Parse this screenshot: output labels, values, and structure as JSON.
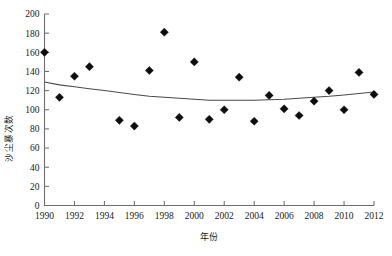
{
  "chart_data": {
    "type": "scatter",
    "title": "",
    "xlabel": "年份",
    "ylabel": "沙尘暴次数",
    "xlim": [
      1990,
      2012
    ],
    "ylim": [
      0,
      200
    ],
    "grid": false,
    "legend": null,
    "x_ticks": [
      "1990",
      "1992",
      "1994",
      "1996",
      "1998",
      "2000",
      "2002",
      "2004",
      "2006",
      "2008",
      "2010",
      "2012"
    ],
    "x_tick_values": [
      1990,
      1992,
      1994,
      1996,
      1998,
      2000,
      2002,
      2004,
      2006,
      2008,
      2010,
      2012
    ],
    "x_minor_ticks": [
      1991,
      1993,
      1995,
      1997,
      1999,
      2001,
      2003,
      2005,
      2007,
      2009,
      2011
    ],
    "y_ticks": [
      "0",
      "20",
      "40",
      "60",
      "80",
      "100",
      "120",
      "140",
      "160",
      "180",
      "200"
    ],
    "y_tick_values": [
      0,
      20,
      40,
      60,
      80,
      100,
      120,
      140,
      160,
      180,
      200
    ],
    "marker_shape": "diamond",
    "marker_color": "#0d0d0d",
    "curve_color": "#4a4a4a",
    "axis_color": "#6e6e6e",
    "series": [
      {
        "name": "沙尘暴次数",
        "x": [
          1990,
          1991,
          1992,
          1993,
          1995,
          1996,
          1997,
          1998,
          1999,
          2000,
          2001,
          2002,
          2003,
          2004,
          2005,
          2006,
          2007,
          2008,
          2009,
          2010,
          2011,
          2012
        ],
        "values": [
          160,
          113,
          135,
          145,
          89,
          83,
          141,
          181,
          92,
          150,
          90,
          100,
          134,
          88,
          115,
          101,
          94,
          109,
          120,
          100,
          139,
          116
        ]
      }
    ],
    "trend": {
      "name": "二次趋势线",
      "type": "quadratic",
      "x": [
        1990,
        1991,
        1992,
        1993,
        1994,
        1995,
        1996,
        1997,
        1998,
        1999,
        2000,
        2001,
        2002,
        2003,
        2004,
        2005,
        2006,
        2007,
        2008,
        2009,
        2010,
        2011,
        2012
      ],
      "values": [
        129,
        126,
        124,
        122,
        120,
        118,
        116,
        114,
        113,
        112,
        111,
        110,
        110,
        110,
        110,
        110.5,
        111,
        112,
        113,
        114,
        115.5,
        117,
        118.5
      ]
    }
  }
}
